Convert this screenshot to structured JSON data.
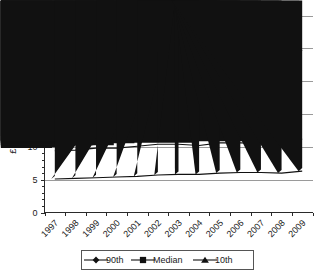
{
  "chart_data": {
    "type": "line",
    "title": "",
    "xlabel": "",
    "ylabel": "£ per hour",
    "categories": [
      "1997",
      "1998",
      "1999",
      "2000",
      "2001",
      "2002",
      "2003",
      "2004",
      "2005",
      "2006",
      "2007",
      "2008",
      "2009"
    ],
    "ylim": [
      0,
      30
    ],
    "yticks": [
      0,
      5,
      10,
      15,
      20,
      25,
      30
    ],
    "ytick_labels": [
      "0",
      "5",
      "10",
      "15",
      "20",
      "25",
      "30"
    ],
    "grid": true,
    "grid_axis": "y",
    "legend_position": "bottom",
    "series": [
      {
        "name": "90th",
        "marker": "diamond",
        "values": [
          20.6,
          20.7,
          21.5,
          21.6,
          22.4,
          23.4,
          23.6,
          22.7,
          23.9,
          24.1,
          23.7,
          23.4,
          24.7
        ]
      },
      {
        "name": "Median",
        "marker": "square",
        "values": [
          9.4,
          9.5,
          9.8,
          9.8,
          10.1,
          10.4,
          10.4,
          10.2,
          10.6,
          10.6,
          10.5,
          10.4,
          11.2
        ]
      },
      {
        "name": "10th",
        "marker": "triangle",
        "values": [
          5.1,
          5.2,
          5.3,
          5.4,
          5.5,
          5.7,
          5.8,
          5.8,
          6.0,
          6.1,
          6.1,
          6.0,
          6.3
        ]
      }
    ]
  },
  "axis": {
    "y_title": "£ per hour"
  },
  "legend": {
    "entries": [
      "90th",
      "Median",
      "10th"
    ]
  },
  "colors": {
    "series": "#111111",
    "gridline": "#9a9a9a",
    "axis": "#2a2a2a",
    "background": "#ffffff"
  }
}
